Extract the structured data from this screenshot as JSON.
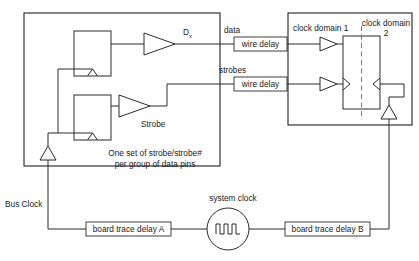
{
  "diagram": {
    "background_color": "#ffffff",
    "line_color": "#2b2b2b",
    "dashed_line_color": "#6a6a6a",
    "labels": {
      "data_out": "D",
      "data_out_sub": "x",
      "strobe_out": "Strobe",
      "data_net": "data",
      "strobes_net": "strobes",
      "wire_delay_data": "wire delay",
      "wire_delay_strobes": "wire delay",
      "clock_domain_1": "clock domain 1",
      "clock_domain_2_line1": "clock domain",
      "clock_domain_2_line2": "2",
      "note_line1": "One set of strobe/strobe#",
      "note_line2": "per group of data pins",
      "bus_clock": "Bus Clock",
      "system_clock": "system clock",
      "board_trace_delay_a": "board trace delay A",
      "board_trace_delay_b": "board trace delay B"
    },
    "components": {
      "transmitter_chip": "transmitter-chip-boundary",
      "receiver_chip": "receiver-chip-boundary",
      "data_flip_flop": "data-flip-flop",
      "strobe_flip_flop": "strobe-flip-flop",
      "data_driver_buffer": "data-driver-buffer",
      "strobe_driver_buffer": "strobe-driver-buffer",
      "data_receiver_buffer": "data-receiver-buffer",
      "strobe_receiver_buffer": "strobe-receiver-buffer",
      "capture_register": "capture-register",
      "tx_clock_buffer": "transmit-clock-buffer",
      "rx_clock_buffer": "receive-clock-buffer",
      "oscillator": "system-clock-oscillator"
    }
  }
}
